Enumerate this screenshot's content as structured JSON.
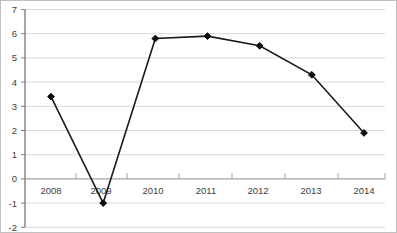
{
  "chart_data": {
    "type": "line",
    "title": "",
    "subtitle": "",
    "xlabel": "",
    "ylabel": "",
    "categories": [
      "2008",
      "2009",
      "2010",
      "2011",
      "2012",
      "2013",
      "2014"
    ],
    "x": [
      2008,
      2009,
      2010,
      2011,
      2012,
      2013,
      2014
    ],
    "values": [
      3.4,
      -1.0,
      5.8,
      5.9,
      5.5,
      4.3,
      1.9
    ],
    "series": [
      {
        "name": "",
        "values": [
          3.4,
          -1.0,
          5.8,
          5.9,
          5.5,
          4.3,
          1.9
        ],
        "line_color": "#1a1a1a",
        "marker": "diamond",
        "marker_color": "#0d0d0d"
      }
    ],
    "ylim": [
      -2,
      7
    ],
    "yticks": [
      -2,
      -1,
      0,
      1,
      2,
      3,
      4,
      5,
      6,
      7
    ],
    "ytick_labels": [
      "-2",
      "-1",
      "0",
      "1",
      "2",
      "3",
      "4",
      "5",
      "6",
      "7"
    ],
    "xtick_labels": [
      "2008",
      "2009",
      "2010",
      "2011",
      "2012",
      "2013",
      "2014"
    ],
    "grid": "horizontal",
    "grid_color": "#d9d9d9",
    "axis_color": "#595959",
    "zero_line_color": "#7f7f7f",
    "plot_border_color": "#bfbfbf",
    "background": "#ffffff",
    "legend": "none",
    "legend_position": "none",
    "annotations": []
  },
  "axis": {
    "y_min_label": "-2",
    "y_max_label": "7"
  }
}
